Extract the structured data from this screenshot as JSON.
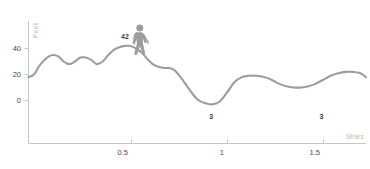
{
  "chart_data": {
    "type": "line",
    "title": "",
    "subtitle": "",
    "xlabel": "Miles",
    "ylabel": "Feet",
    "xlim": [
      0,
      1.82
    ],
    "ylim": [
      -8,
      52
    ],
    "grid": false,
    "legend": null,
    "x_ticks": [
      {
        "value": 0.5,
        "label": "0.5"
      },
      {
        "value": 1.0,
        "label": "1"
      },
      {
        "value": 1.5,
        "label": "1.5"
      }
    ],
    "y_ticks": [
      {
        "value": 0,
        "label": "0"
      },
      {
        "value": 20,
        "label": "20"
      },
      {
        "value": 40,
        "label": "40"
      }
    ],
    "series": [
      {
        "name": "Elevation profile",
        "color": "#9d9d9d",
        "x": [
          0.0,
          0.03,
          0.06,
          0.1,
          0.13,
          0.16,
          0.19,
          0.22,
          0.25,
          0.28,
          0.31,
          0.34,
          0.37,
          0.4,
          0.43,
          0.46,
          0.49,
          0.52,
          0.55,
          0.58,
          0.61,
          0.64,
          0.67,
          0.7,
          0.73,
          0.76,
          0.79,
          0.82,
          0.85,
          0.88,
          0.91,
          0.95,
          0.99,
          1.03,
          1.07,
          1.11,
          1.15,
          1.19,
          1.23,
          1.27,
          1.31,
          1.35,
          1.39,
          1.43,
          1.47,
          1.51,
          1.55,
          1.59,
          1.63,
          1.67,
          1.71,
          1.75,
          1.79,
          1.82
        ],
        "y": [
          18,
          20,
          27,
          33,
          35,
          34,
          30,
          28,
          30,
          33,
          33,
          31,
          28,
          30,
          35,
          39,
          41,
          42,
          42,
          40,
          37,
          32,
          28,
          26,
          25,
          25,
          23,
          18,
          12,
          6,
          1,
          -2,
          -3,
          -1,
          6,
          14,
          18,
          19,
          19,
          18,
          16,
          13,
          11,
          10,
          10,
          11,
          13,
          16,
          19,
          21,
          22,
          22,
          21,
          18
        ]
      }
    ],
    "annotations": [
      {
        "label": "42",
        "x": 0.52,
        "y": 42,
        "kind": "peak-label"
      },
      {
        "label": "3",
        "x": 0.985,
        "y": -3,
        "kind": "valley-label"
      },
      {
        "label": "3",
        "x": 1.58,
        "y": -3,
        "kind": "valley-label"
      }
    ],
    "markers": [
      {
        "kind": "hiker-icon",
        "x": 0.6,
        "y": 30,
        "label": "hiker"
      }
    ],
    "colors": {
      "line": "#9d9d9d",
      "axis": "#c6c6c6",
      "tick_text": "#4a4a4a",
      "axis_title": "#b9b9b9",
      "annotation_text": "#3d3d3d",
      "background": "#ffffff"
    }
  },
  "chart": {
    "y_axis_title": "Feet",
    "x_axis_title": "Miles",
    "y_tick_labels": [
      "40",
      "20",
      "0"
    ],
    "x_tick_labels": [
      "0.5",
      "1",
      "1.5"
    ],
    "peak_label": "42",
    "valley_label_1": "3",
    "valley_label_2": "3"
  }
}
